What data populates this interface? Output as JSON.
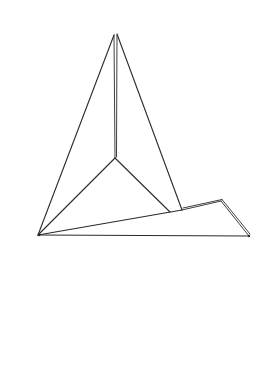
{
  "figure": {
    "stroke_color": "#2a2a2a",
    "background_color": "#ffffff",
    "vertices": {
      "apex_left": [
        114,
        35
      ],
      "apex_right": [
        117,
        34
      ],
      "center": [
        115,
        158
      ],
      "base_left": [
        38,
        235
      ],
      "base_right": [
        249,
        236
      ],
      "slant_inner": [
        170,
        212
      ],
      "slant_sail": [
        182,
        210
      ],
      "flap_corner": [
        221,
        201
      ]
    },
    "edges": [
      {
        "name": "sail-left-edge",
        "from": "base_left",
        "to": "apex_left"
      },
      {
        "name": "sail-right-edge",
        "from": "apex_right",
        "to": "slant_sail"
      },
      {
        "name": "mast",
        "from": "apex_left",
        "to": "center",
        "double": true
      },
      {
        "name": "inner-left-crease",
        "from": "center",
        "to": "base_left"
      },
      {
        "name": "inner-right-crease",
        "from": "center",
        "to": "slant_inner"
      },
      {
        "name": "slant-edge",
        "from": "base_left",
        "to": "flap_corner"
      },
      {
        "name": "flap-top-edge",
        "from": "slant_sail",
        "to": "flap_corner",
        "double": true
      },
      {
        "name": "flap-right-edge",
        "from": "flap_corner",
        "to": "base_right",
        "double": true
      },
      {
        "name": "bottom-edge",
        "from": "base_left",
        "to": "base_right"
      }
    ]
  }
}
